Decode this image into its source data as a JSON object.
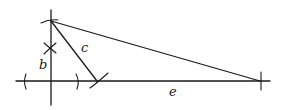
{
  "diagram": {
    "type": "geometric-construction",
    "labels": {
      "b": "b",
      "c": "c",
      "e": "e"
    },
    "colors": {
      "stroke": "#1a1a1a",
      "background": "#ffffff"
    },
    "points": {
      "top_vertex": [
        51,
        21
      ],
      "origin": [
        51,
        81
      ],
      "c_foot": [
        97,
        81
      ],
      "e_end": [
        260,
        81
      ],
      "b_mark": [
        50,
        48
      ]
    },
    "segments": [
      {
        "name": "vertical-axis",
        "from": [
          51,
          10
        ],
        "to": [
          51,
          105
        ]
      },
      {
        "name": "horizontal-axis",
        "from": [
          16,
          81
        ],
        "to": [
          270,
          81
        ]
      },
      {
        "name": "segment-c",
        "from": [
          51,
          21
        ],
        "to": [
          97,
          81
        ]
      },
      {
        "name": "hypotenuse",
        "from": [
          51,
          21
        ],
        "to": [
          260,
          81
        ]
      }
    ]
  }
}
